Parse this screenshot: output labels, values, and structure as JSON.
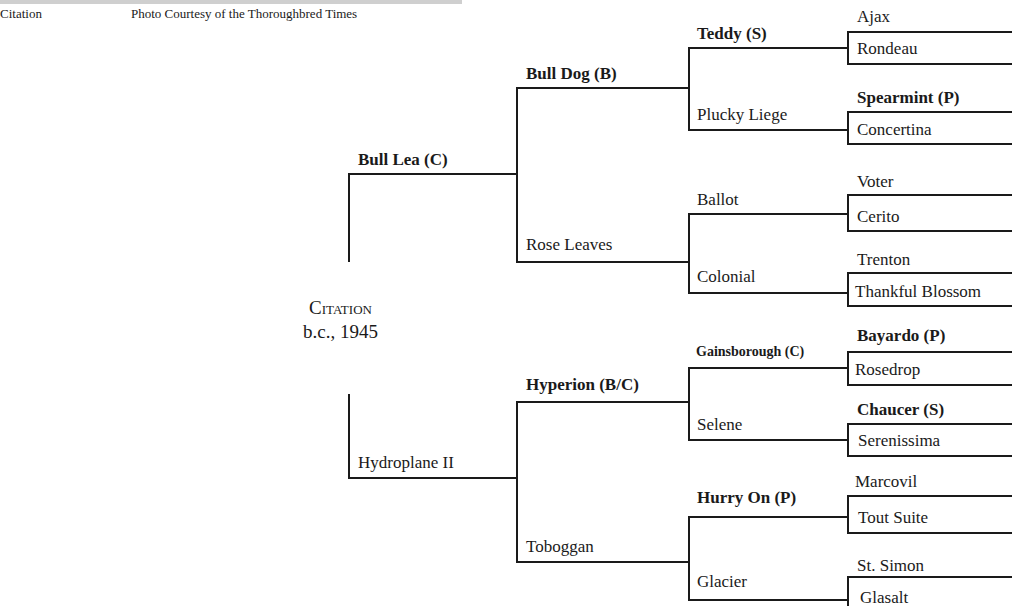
{
  "header": {
    "left_caption": "Citation",
    "right_caption": "Photo Courtesy of the Thoroughbred Times"
  },
  "root": {
    "name": "Citation",
    "info": "b.c., 1945"
  },
  "pedigree": {
    "sire": "Bull Lea (C)",
    "dam": "Hydroplane II",
    "sire_sire": "Bull Dog (B)",
    "sire_dam": "Rose Leaves",
    "dam_sire": "Hyperion (B/C)",
    "dam_dam": "Toboggan",
    "g3": [
      "Teddy (S)",
      "Plucky Liege",
      "Ballot",
      "Colonial",
      "Gainsborough (C)",
      "Selene",
      "Hurry On (P)",
      "Glacier"
    ],
    "g4": [
      "Ajax",
      "Rondeau",
      "Spearmint (P)",
      "Concertina",
      "Voter",
      "Cerito",
      "Trenton",
      "Thankful Blossom",
      "Bayardo (P)",
      "Rosedrop",
      "Chaucer (S)",
      "Serenissima",
      "Marcovil",
      "Tout Suite",
      "St. Simon",
      "Glasalt"
    ]
  }
}
